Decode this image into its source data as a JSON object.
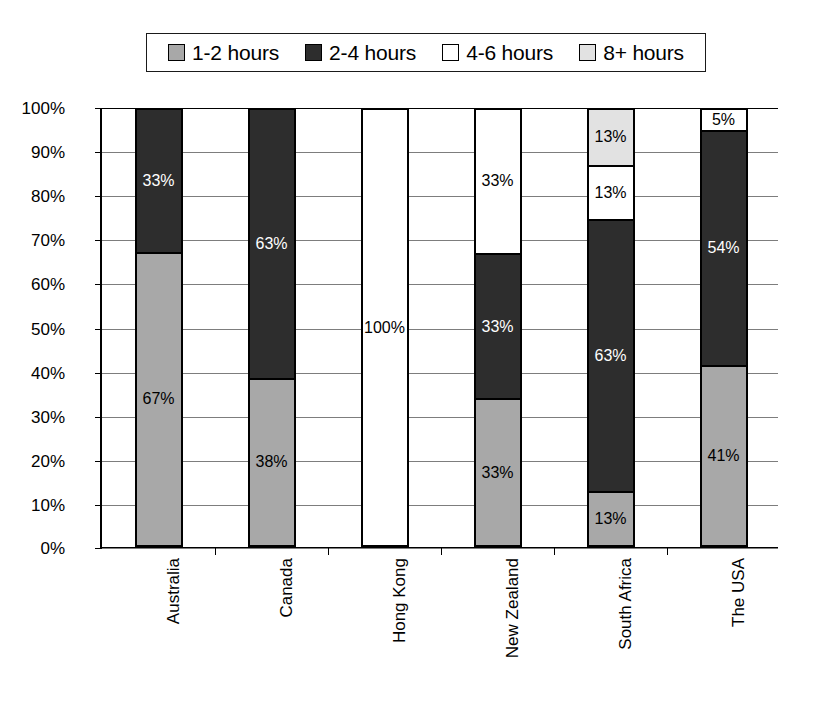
{
  "legend": {
    "entries": [
      {
        "label": "1-2 hours",
        "color": "#a8a8a8",
        "key": "h1_2"
      },
      {
        "label": "2-4 hours",
        "color": "#2d2d2d",
        "key": "h2_4"
      },
      {
        "label": "4-6 hours",
        "color": "#ffffff",
        "key": "h4_6"
      },
      {
        "label": "8+ hours",
        "color": "#e2e2e2",
        "key": "h8p"
      }
    ]
  },
  "axis": {
    "y_ticks": [
      "0%",
      "10%",
      "20%",
      "30%",
      "40%",
      "50%",
      "60%",
      "70%",
      "80%",
      "90%",
      "100%"
    ],
    "x_categories": [
      "Australia",
      "Canada",
      "Hong Kong",
      "New Zealand",
      "South Africa",
      "The USA"
    ]
  },
  "chart_data": {
    "type": "bar",
    "subtype": "stacked-100-percent",
    "title": "",
    "xlabel": "",
    "ylabel": "",
    "ylim": [
      0,
      100
    ],
    "ytick_step": 10,
    "grid": true,
    "legend_position": "top",
    "categories": [
      "Australia",
      "Canada",
      "Hong Kong",
      "New Zealand",
      "South Africa",
      "The USA"
    ],
    "series": [
      {
        "name": "1-2 hours",
        "color": "#a8a8a8",
        "values": [
          67,
          38,
          0,
          33,
          13,
          41
        ]
      },
      {
        "name": "2-4 hours",
        "color": "#2d2d2d",
        "values": [
          33,
          63,
          0,
          33,
          63,
          54
        ]
      },
      {
        "name": "4-6 hours",
        "color": "#ffffff",
        "values": [
          0,
          0,
          100,
          33,
          13,
          5
        ]
      },
      {
        "name": "8+ hours",
        "color": "#e2e2e2",
        "values": [
          0,
          0,
          0,
          0,
          13,
          0
        ]
      }
    ],
    "bars": [
      {
        "category": "Australia",
        "segments": [
          {
            "series": "1-2 hours",
            "value": 67,
            "label": "67%",
            "color": "#a8a8a8",
            "text_color": "#000000"
          },
          {
            "series": "2-4 hours",
            "value": 33,
            "label": "33%",
            "color": "#2d2d2d",
            "text_color": "#ffffff"
          }
        ]
      },
      {
        "category": "Canada",
        "segments": [
          {
            "series": "1-2 hours",
            "value": 38,
            "label": "38%",
            "color": "#a8a8a8",
            "text_color": "#000000"
          },
          {
            "series": "2-4 hours",
            "value": 62,
            "label": "63%",
            "color": "#2d2d2d",
            "text_color": "#ffffff"
          }
        ]
      },
      {
        "category": "Hong Kong",
        "segments": [
          {
            "series": "4-6 hours",
            "value": 100,
            "label": "100%",
            "color": "#ffffff",
            "text_color": "#000000"
          }
        ]
      },
      {
        "category": "New Zealand",
        "segments": [
          {
            "series": "1-2 hours",
            "value": 33.3,
            "label": "33%",
            "color": "#a8a8a8",
            "text_color": "#000000"
          },
          {
            "series": "2-4 hours",
            "value": 33.4,
            "label": "33%",
            "color": "#2d2d2d",
            "text_color": "#ffffff"
          },
          {
            "series": "4-6 hours",
            "value": 33.3,
            "label": "33%",
            "color": "#ffffff",
            "text_color": "#000000"
          }
        ]
      },
      {
        "category": "South Africa",
        "segments": [
          {
            "series": "1-2 hours",
            "value": 12,
            "label": "13%",
            "color": "#a8a8a8",
            "text_color": "#000000"
          },
          {
            "series": "2-4 hours",
            "value": 62.5,
            "label": "63%",
            "color": "#2d2d2d",
            "text_color": "#ffffff"
          },
          {
            "series": "4-6 hours",
            "value": 12.5,
            "label": "13%",
            "color": "#ffffff",
            "text_color": "#000000"
          },
          {
            "series": "8+ hours",
            "value": 13,
            "label": "13%",
            "color": "#e2e2e2",
            "text_color": "#000000"
          }
        ]
      },
      {
        "category": "The USA",
        "segments": [
          {
            "series": "1-2 hours",
            "value": 41,
            "label": "41%",
            "color": "#a8a8a8",
            "text_color": "#000000"
          },
          {
            "series": "2-4 hours",
            "value": 54,
            "label": "54%",
            "color": "#2d2d2d",
            "text_color": "#ffffff"
          },
          {
            "series": "4-6 hours",
            "value": 5,
            "label": "5%",
            "color": "#ffffff",
            "text_color": "#000000"
          }
        ]
      }
    ]
  }
}
